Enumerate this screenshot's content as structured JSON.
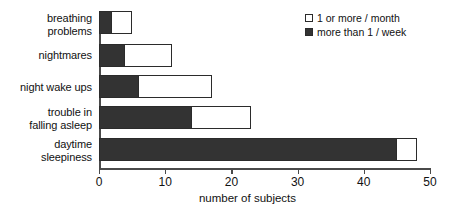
{
  "chart_data": {
    "type": "bar",
    "orientation": "horizontal",
    "stacked": true,
    "title": "",
    "xlabel": "number of subjects",
    "ylabel": "",
    "xlim": [
      0,
      50
    ],
    "xticks": [
      0,
      10,
      20,
      30,
      40,
      50
    ],
    "grid": false,
    "legend_position": "top-right",
    "categories": [
      "breathing\nproblems",
      "nightmares",
      "night wake ups",
      "trouble in\nfalling asleep",
      "daytime\nsleepiness"
    ],
    "series": [
      {
        "name": "more than 1 / week",
        "swatch": "filled",
        "color": "#333333",
        "values": [
          2,
          4,
          6,
          14,
          45
        ]
      },
      {
        "name": "1 or more / month",
        "swatch": "open",
        "color": "#ffffff",
        "values": [
          5,
          11,
          17,
          23,
          48
        ]
      }
    ]
  },
  "legend": {
    "entries": [
      {
        "label": "1 or more / month",
        "swatch": "open"
      },
      {
        "label": "more than 1 / week",
        "swatch": "filled"
      }
    ]
  },
  "axis": {
    "x_title": "number of subjects",
    "tick_labels": [
      "0",
      "10",
      "20",
      "30",
      "40",
      "50"
    ]
  },
  "colors": {
    "bar_fill_dark": "#333333",
    "bar_fill_light": "#ffffff",
    "bar_outline": "#2b2b2b",
    "axis": "#4a4a4a",
    "text": "#111111",
    "background": "#ffffff"
  }
}
